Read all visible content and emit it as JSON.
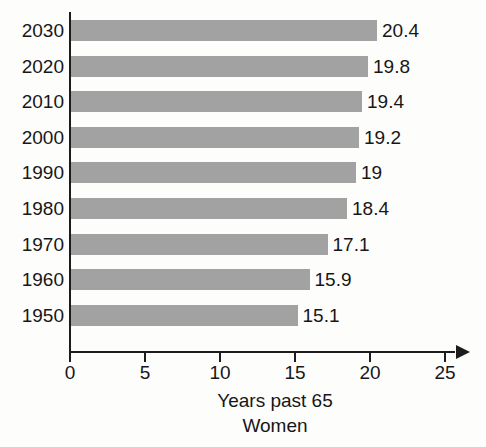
{
  "chart_data": {
    "type": "bar",
    "orientation": "horizontal",
    "title": "",
    "subtitle": "",
    "xlabel": "Years past 65",
    "ylabel": "",
    "caption": "Women",
    "categories": [
      "2030",
      "2020",
      "2010",
      "2000",
      "1990",
      "1980",
      "1970",
      "1960",
      "1950"
    ],
    "values": [
      20.4,
      19.8,
      19.4,
      19.2,
      19,
      18.4,
      17.1,
      15.9,
      15.1
    ],
    "value_labels": [
      "20.4",
      "19.8",
      "19.4",
      "19.2",
      "19",
      "18.4",
      "17.1",
      "15.9",
      "15.1"
    ],
    "xlim": [
      0,
      25
    ],
    "xticks": [
      0,
      5,
      10,
      15,
      20,
      25
    ],
    "xtick_labels": [
      "0",
      "5",
      "10",
      "15",
      "20",
      "25"
    ],
    "grid": false,
    "legend": "none",
    "bar_color": "#a2a2a2",
    "axis_color": "#1c1c1c",
    "text_color": "#171717",
    "background_color": "#fdfdfc"
  }
}
